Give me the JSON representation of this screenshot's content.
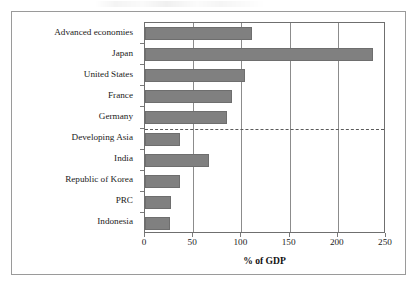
{
  "figure": {
    "frame_border_color": "#9a9a9a",
    "background": "#ffffff"
  },
  "chart_data": {
    "type": "bar",
    "orientation": "horizontal",
    "title": "",
    "subtitle": "",
    "xlabel": "% of GDP",
    "ylabel": "",
    "xlim": [
      0,
      250
    ],
    "xticks": [
      0,
      50,
      100,
      150,
      200,
      250
    ],
    "xtick_labels": [
      "0",
      "50",
      "100",
      "150",
      "200",
      "250"
    ],
    "grid": "vertical gridlines at 50, 100, 150, 200",
    "legend": "none",
    "bar_color": "#808080",
    "bar_edge_color": "#6e6e6e",
    "axis_color": "#6f6f6f",
    "categories": [
      "Advanced economies",
      "Japan",
      "United States",
      "France",
      "Germany",
      "Developing Asia",
      "India",
      "Republic of Korea",
      "PRC",
      "Indonesia"
    ],
    "values": [
      111,
      237,
      104,
      90,
      85,
      36,
      66,
      36,
      27,
      26
    ],
    "annotations": [
      {
        "name": "group-separator",
        "kind": "dashed-horizontal-line",
        "between": [
          "Germany",
          "Developing Asia"
        ],
        "color": "#5a5a5a"
      }
    ]
  }
}
